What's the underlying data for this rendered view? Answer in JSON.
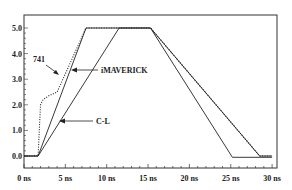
{
  "chart_data": {
    "type": "line",
    "title": "",
    "xlabel": "",
    "ylabel": "",
    "xlim": [
      0,
      30
    ],
    "ylim": [
      -0.3,
      5.5
    ],
    "x_ticks": [
      0,
      5,
      10,
      15,
      20,
      25,
      30
    ],
    "x_tick_labels": [
      "0 ns",
      "5 ns",
      "10 ns",
      "15 ns",
      "20 ns",
      "25 ns",
      "30 ns"
    ],
    "y_ticks": [
      0,
      1,
      2,
      3,
      4,
      5
    ],
    "y_tick_labels": [
      "0.0",
      "1.0",
      "2.0",
      "3.0",
      "4.0",
      "5.0"
    ],
    "grid": false,
    "legend": "none (inline arrow annotations)",
    "series": [
      {
        "name": "741",
        "style": "dotted",
        "x": [
          0,
          1.7,
          2.0,
          2.3,
          3.0,
          4.0,
          7.5,
          15.3,
          28.5,
          30
        ],
        "y": [
          0,
          0,
          2.0,
          2.2,
          2.35,
          2.5,
          5.0,
          5.0,
          0.0,
          0.0
        ]
      },
      {
        "name": "iMAVERICK",
        "style": "solid",
        "x": [
          0,
          1.7,
          7.5,
          15.3,
          28.5,
          30
        ],
        "y": [
          0,
          0,
          5.0,
          5.0,
          0.0,
          0.0
        ]
      },
      {
        "name": "C-L",
        "style": "solid",
        "x": [
          0,
          1.7,
          11.5,
          15.3,
          25.2,
          30
        ],
        "y": [
          0,
          0,
          5.0,
          5.0,
          -0.05,
          -0.05
        ]
      }
    ],
    "annotations": [
      {
        "text": "741",
        "points_to_series": "741"
      },
      {
        "text": "iMAVERICK",
        "points_to_series": "iMAVERICK"
      },
      {
        "text": "C-L",
        "points_to_series": "C-L"
      }
    ]
  }
}
